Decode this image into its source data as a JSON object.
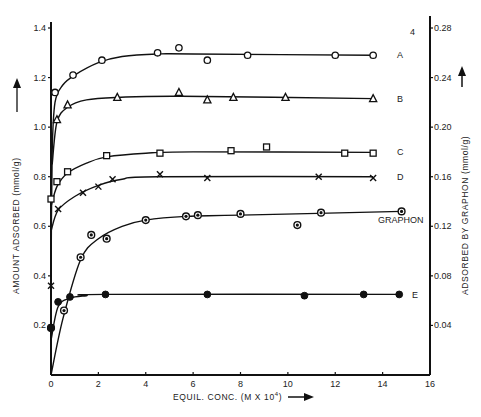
{
  "chart_data": {
    "type": "line",
    "title": "",
    "xlabel": "EQUIL. CONC. (M X 10",
    "xlabel_superscript": "4",
    "xlabel_suffix": ")",
    "ylabel": "AMOUNT ADSORBED  (mmol/g)",
    "ylabel_right": "ADSORBED BY GRAPHON  (mmol/g)",
    "right_axis_top_note": "4",
    "xlim": [
      0,
      16
    ],
    "ylim": [
      0,
      1.4
    ],
    "ylim_right": [
      0,
      0.28
    ],
    "x_ticks": [
      0,
      2,
      4,
      6,
      8,
      10,
      12,
      14,
      16
    ],
    "x_tick_labels": [
      "0",
      "2",
      "4",
      "6",
      "8",
      "10",
      "12",
      "14",
      "16"
    ],
    "y_ticks": [
      0.2,
      0.4,
      0.6,
      0.8,
      1.0,
      1.2,
      1.4
    ],
    "y_tick_labels": [
      "0.2",
      "0.4",
      "0.6",
      "0.8",
      "1.0",
      "1.2",
      "1.4"
    ],
    "y_right_ticks": [
      0.04,
      0.08,
      0.12,
      0.16,
      0.2,
      0.24,
      0.28
    ],
    "y_right_tick_labels": [
      "0.04",
      "0.08",
      "0.12",
      "0.16",
      "0.20",
      "0.24",
      "0.28"
    ],
    "grid": false,
    "series": [
      {
        "name": "A",
        "label": "A",
        "marker": "open-circle",
        "axis": "left",
        "points": [
          [
            0.17,
            1.14
          ],
          [
            0.93,
            1.21
          ],
          [
            2.15,
            1.27
          ],
          [
            4.5,
            1.3
          ],
          [
            5.4,
            1.32
          ],
          [
            6.6,
            1.27
          ],
          [
            8.3,
            1.29
          ],
          [
            12.0,
            1.29
          ],
          [
            13.6,
            1.29
          ]
        ],
        "curve": [
          [
            0,
            0.35
          ],
          [
            0.05,
            0.9
          ],
          [
            0.17,
            1.1
          ],
          [
            0.5,
            1.17
          ],
          [
            1.0,
            1.21
          ],
          [
            2.0,
            1.26
          ],
          [
            3.0,
            1.285
          ],
          [
            4.5,
            1.295
          ],
          [
            6,
            1.295
          ],
          [
            13.6,
            1.29
          ]
        ]
      },
      {
        "name": "B",
        "label": "B",
        "marker": "open-triangle",
        "axis": "left",
        "points": [
          [
            0.25,
            1.03
          ],
          [
            0.7,
            1.09
          ],
          [
            2.8,
            1.12
          ],
          [
            5.4,
            1.14
          ],
          [
            6.6,
            1.11
          ],
          [
            7.7,
            1.12
          ],
          [
            9.9,
            1.12
          ],
          [
            13.6,
            1.115
          ]
        ],
        "curve": [
          [
            0.05,
            0.85
          ],
          [
            0.25,
            1.02
          ],
          [
            0.7,
            1.08
          ],
          [
            1.5,
            1.11
          ],
          [
            2.8,
            1.12
          ],
          [
            5.5,
            1.125
          ],
          [
            13.6,
            1.115
          ]
        ]
      },
      {
        "name": "C",
        "label": "C",
        "marker": "open-square",
        "axis": "left",
        "points": [
          [
            0.0,
            0.71
          ],
          [
            0.25,
            0.78
          ],
          [
            0.7,
            0.82
          ],
          [
            2.35,
            0.885
          ],
          [
            4.6,
            0.895
          ],
          [
            7.6,
            0.905
          ],
          [
            9.1,
            0.92
          ],
          [
            12.4,
            0.895
          ],
          [
            13.6,
            0.895
          ]
        ],
        "curve": [
          [
            0.0,
            0.68
          ],
          [
            0.25,
            0.76
          ],
          [
            0.7,
            0.815
          ],
          [
            1.5,
            0.855
          ],
          [
            2.35,
            0.88
          ],
          [
            4.0,
            0.895
          ],
          [
            6,
            0.9
          ],
          [
            13.6,
            0.898
          ]
        ]
      },
      {
        "name": "D",
        "label": "D",
        "marker": "cross",
        "axis": "left",
        "points": [
          [
            0.0,
            0.36
          ],
          [
            0.3,
            0.67
          ],
          [
            1.35,
            0.735
          ],
          [
            2.0,
            0.76
          ],
          [
            2.6,
            0.79
          ],
          [
            4.6,
            0.81
          ],
          [
            6.6,
            0.795
          ],
          [
            11.3,
            0.8
          ],
          [
            13.6,
            0.795
          ]
        ],
        "curve": [
          [
            0.0,
            0.58
          ],
          [
            0.3,
            0.665
          ],
          [
            1.0,
            0.72
          ],
          [
            2.0,
            0.765
          ],
          [
            3.0,
            0.79
          ],
          [
            4.5,
            0.8
          ],
          [
            13.6,
            0.8
          ]
        ]
      },
      {
        "name": "GRAPHON",
        "label": "GRAPHON",
        "marker": "half-filled-circle",
        "axis": "right",
        "points": [
          [
            0.0,
            0.038
          ],
          [
            0.55,
            0.052
          ],
          [
            1.25,
            0.095
          ],
          [
            1.7,
            0.113
          ],
          [
            2.35,
            0.11
          ],
          [
            4.0,
            0.125
          ],
          [
            5.7,
            0.128
          ],
          [
            6.2,
            0.129
          ],
          [
            8.0,
            0.13
          ],
          [
            10.4,
            0.121
          ],
          [
            11.4,
            0.131
          ],
          [
            14.8,
            0.132
          ]
        ],
        "curve": [
          [
            0.0,
            0.0
          ],
          [
            0.5,
            0.045
          ],
          [
            1.25,
            0.093
          ],
          [
            2.0,
            0.11
          ],
          [
            3.0,
            0.12
          ],
          [
            4.0,
            0.125
          ],
          [
            5.7,
            0.128
          ],
          [
            8.0,
            0.129
          ],
          [
            14.8,
            0.132
          ]
        ]
      },
      {
        "name": "E",
        "label": "E",
        "marker": "filled-circle",
        "axis": "left",
        "points": [
          [
            0.0,
            0.19
          ],
          [
            0.3,
            0.295
          ],
          [
            0.8,
            0.315
          ],
          [
            2.3,
            0.325
          ],
          [
            6.6,
            0.325
          ],
          [
            10.7,
            0.32
          ],
          [
            13.2,
            0.325
          ],
          [
            14.7,
            0.325
          ]
        ],
        "curve": [
          [
            0.0,
            0.14
          ],
          [
            0.3,
            0.275
          ],
          [
            0.8,
            0.31
          ],
          [
            1.5,
            0.32
          ],
          [
            2.3,
            0.325
          ],
          [
            14.7,
            0.325
          ]
        ]
      }
    ]
  }
}
